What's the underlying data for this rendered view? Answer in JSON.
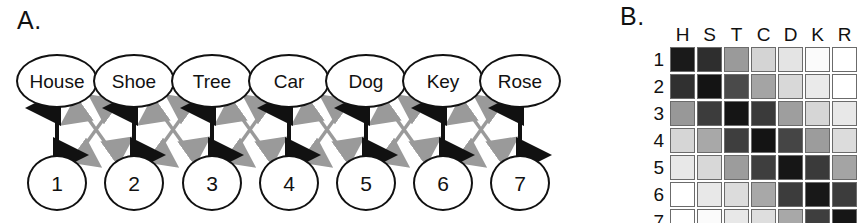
{
  "panels": {
    "a": {
      "label": "A."
    },
    "b": {
      "label": "B."
    }
  },
  "diagram": {
    "words": [
      "House",
      "Shoe",
      "Tree",
      "Car",
      "Dog",
      "Key",
      "Rose"
    ],
    "numbers": [
      "1",
      "2",
      "3",
      "4",
      "5",
      "6",
      "7"
    ],
    "vertical_arrow_color": "#111111",
    "diagonal_arrow_color": "#9a9a9a",
    "vertical_arrow_name": "black-double-arrow",
    "diagonal_arrow_name": "gray-double-arrow",
    "node_outline_color": "#111111",
    "node_fill_color": "#ffffff"
  },
  "chart_data": {
    "type": "heatmap",
    "title": "",
    "xlabel": "",
    "ylabel": "",
    "column_labels": [
      "H",
      "S",
      "T",
      "C",
      "D",
      "K",
      "R"
    ],
    "row_labels": [
      "1",
      "2",
      "3",
      "4",
      "5",
      "6",
      "7"
    ],
    "column_full_names": [
      "House",
      "Shoe",
      "Tree",
      "Car",
      "Dog",
      "Key",
      "Rose"
    ],
    "grid": true,
    "legend_position": "none",
    "value_range": [
      0,
      100
    ],
    "colormap": "grayscale-inverted",
    "values": [
      [
        100,
        88,
        48,
        24,
        16,
        4,
        2
      ],
      [
        86,
        98,
        72,
        44,
        22,
        12,
        4
      ],
      [
        50,
        80,
        98,
        78,
        46,
        22,
        14
      ],
      [
        24,
        44,
        80,
        100,
        76,
        46,
        20
      ],
      [
        14,
        24,
        48,
        78,
        98,
        80,
        44
      ],
      [
        2,
        14,
        22,
        44,
        80,
        100,
        82
      ],
      [
        2,
        4,
        14,
        20,
        44,
        80,
        98
      ]
    ],
    "cell_colors": [
      [
        "#1a1a1a",
        "#2e2e2e",
        "#9a9a9a",
        "#d4d4d4",
        "#e4e4e4",
        "#fbfbfb",
        "#ffffff"
      ],
      [
        "#303030",
        "#141414",
        "#4a4a4a",
        "#a4a4a4",
        "#d8d8d8",
        "#eaeaea",
        "#ffffff"
      ],
      [
        "#989898",
        "#3c3c3c",
        "#151515",
        "#3a3a3a",
        "#9e9e9e",
        "#d6d6d6",
        "#e8e8e8"
      ],
      [
        "#d6d6d6",
        "#a8a8a8",
        "#3e3e3e",
        "#141414",
        "#454545",
        "#9c9c9c",
        "#dcdcdc"
      ],
      [
        "#e8e8e8",
        "#d8d8d8",
        "#9c9c9c",
        "#3e3e3e",
        "#161616",
        "#3a3a3a",
        "#a4a4a4"
      ],
      [
        "#ffffff",
        "#e8e8e8",
        "#dcdcdc",
        "#a8a8a8",
        "#3c3c3c",
        "#181818",
        "#3c3c3c"
      ],
      [
        "#ffffff",
        "#fbfbfb",
        "#e8e8e8",
        "#dedede",
        "#a8a8a8",
        "#3e3e3e",
        "#161616"
      ]
    ]
  }
}
